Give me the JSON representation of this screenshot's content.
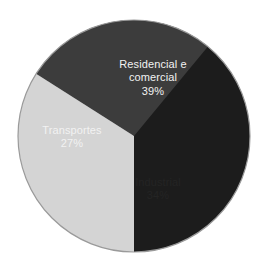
{
  "chart_data": {
    "type": "pie",
    "title": "",
    "subtitle": "",
    "xlabel": "",
    "ylabel": "",
    "legend_position": "none",
    "grid": false,
    "labels_inside_slices": true,
    "categories": [
      "Residencial e comercial",
      "Industrial",
      "Transportes"
    ],
    "values": [
      39,
      34,
      27
    ],
    "value_unit": "%",
    "total": 100,
    "slices": [
      {
        "name": "Residencial e comercial",
        "label_line_1": "Residencial e",
        "label_line_2": "comercial",
        "value": 39,
        "value_label": "39%",
        "color": "#1c1c1c",
        "text_color": "#f2f2f2",
        "start_angle_deg": 230.4,
        "end_angle_deg": 90.0
      },
      {
        "name": "Industrial",
        "label_line_1": "Industrial",
        "label_line_2": "",
        "value": 34,
        "value_label": "34%",
        "color": "#d4d4d4",
        "text_color": "#242424",
        "start_angle_deg": 90.0,
        "end_angle_deg": 212.4
      },
      {
        "name": "Transportes",
        "label_line_1": "Transportes",
        "label_line_2": "",
        "value": 27,
        "value_label": "27%",
        "color": "#3c3c3c",
        "text_color": "#f2f2f2",
        "start_angle_deg": 212.4,
        "end_angle_deg": 309.6
      }
    ],
    "geometry": {
      "center_x": 134,
      "center_y": 136,
      "radius": 116
    },
    "background_color": "#ffffff",
    "outline_color": "#9a9a9a"
  }
}
